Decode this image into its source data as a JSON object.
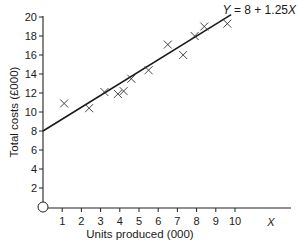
{
  "chart_data": {
    "type": "scatter",
    "title": "",
    "xlabel": "Units produced (000)",
    "ylabel": "Total costs (£000)",
    "x_axis_symbol": "X",
    "origin_label": "O",
    "xlim": [
      0,
      11.5
    ],
    "ylim": [
      0,
      20
    ],
    "x_ticks": [
      1,
      2,
      3,
      4,
      5,
      6,
      7,
      8,
      9,
      10
    ],
    "y_ticks": [
      2,
      4,
      6,
      8,
      10,
      12,
      14,
      16,
      18,
      20
    ],
    "grid": false,
    "marker": "x",
    "points": [
      {
        "x": 1.1,
        "y": 10.9
      },
      {
        "x": 2.4,
        "y": 10.4
      },
      {
        "x": 3.2,
        "y": 12.1
      },
      {
        "x": 3.9,
        "y": 11.9
      },
      {
        "x": 4.2,
        "y": 12.2
      },
      {
        "x": 4.6,
        "y": 13.5
      },
      {
        "x": 5.5,
        "y": 14.4
      },
      {
        "x": 6.5,
        "y": 17.1
      },
      {
        "x": 7.3,
        "y": 16.0
      },
      {
        "x": 7.9,
        "y": 18.0
      },
      {
        "x": 8.4,
        "y": 19.0
      },
      {
        "x": 9.6,
        "y": 19.3
      }
    ],
    "regression_line": {
      "label": "Y = 8 + 1.25X",
      "intercept": 8,
      "slope": 1.25,
      "x_range": [
        0,
        9.8
      ]
    }
  }
}
